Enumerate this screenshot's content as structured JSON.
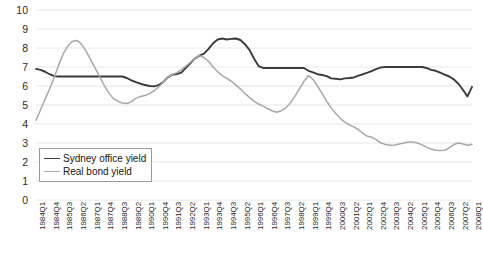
{
  "chart_data": {
    "type": "line",
    "title": "",
    "xlabel": "",
    "ylabel": "",
    "ylim": [
      0,
      10
    ],
    "yticks": [
      0,
      1,
      2,
      3,
      4,
      5,
      6,
      7,
      8,
      9,
      10
    ],
    "grid": true,
    "grid_axis": "y",
    "legend_position": "lower-left-inside",
    "x": [
      "1984Q1",
      "1984Q2",
      "1984Q3",
      "1984Q4",
      "1985Q1",
      "1985Q2",
      "1985Q3",
      "1985Q4",
      "1986Q1",
      "1986Q2",
      "1986Q3",
      "1986Q4",
      "1987Q1",
      "1987Q2",
      "1987Q3",
      "1987Q4",
      "1988Q1",
      "1988Q2",
      "1988Q3",
      "1988Q4",
      "1989Q1",
      "1989Q2",
      "1989Q3",
      "1989Q4",
      "1990Q1",
      "1990Q2",
      "1990Q3",
      "1990Q4",
      "1991Q1",
      "1991Q2",
      "1991Q3",
      "1991Q4",
      "1992Q1",
      "1992Q2",
      "1992Q3",
      "1992Q4",
      "1993Q1",
      "1993Q2",
      "1993Q3",
      "1993Q4",
      "1994Q1",
      "1994Q2",
      "1994Q3",
      "1994Q4",
      "1995Q1",
      "1995Q2",
      "1995Q3",
      "1995Q4",
      "1996Q1",
      "1996Q2",
      "1996Q3",
      "1996Q4",
      "1997Q1",
      "1997Q2",
      "1997Q3",
      "1997Q4",
      "1998Q1",
      "1998Q2",
      "1998Q3",
      "1998Q4",
      "1999Q1",
      "1999Q2",
      "1999Q3",
      "1999Q4",
      "2000Q1",
      "2000Q2",
      "2000Q3",
      "2000Q4",
      "2001Q1",
      "2001Q2",
      "2001Q3",
      "2001Q4",
      "2002Q1",
      "2002Q2",
      "2002Q3",
      "2002Q4",
      "2003Q1",
      "2003Q2",
      "2003Q3",
      "2003Q4",
      "2004Q1",
      "2004Q2",
      "2004Q3",
      "2004Q4",
      "2005Q1",
      "2005Q2",
      "2005Q3",
      "2005Q4",
      "2006Q1",
      "2006Q2",
      "2006Q3",
      "2006Q4",
      "2007Q1",
      "2007Q2",
      "2007Q3",
      "2007Q4",
      "2008Q1"
    ],
    "xtick_labels": [
      "1984Q1",
      "1984Q4",
      "1985Q3",
      "1986Q2",
      "1987Q1",
      "1987Q4",
      "1988Q3",
      "1989Q2",
      "1990Q1",
      "1990Q4",
      "1991Q3",
      "1992Q2",
      "1993Q1",
      "1993Q4",
      "1994Q3",
      "1995Q2",
      "1996Q1",
      "1996Q4",
      "1997Q3",
      "1998Q2",
      "1999Q1",
      "1999Q4",
      "2000Q3",
      "2001Q2",
      "2002Q1",
      "2002Q4",
      "2003Q3",
      "2004Q2",
      "2005Q1",
      "2005Q4",
      "2006Q3",
      "2007Q2",
      "2008Q1"
    ],
    "xtick_step": 3,
    "series": [
      {
        "name": "Sydney office yield",
        "color": "#3a3a3a",
        "values": [
          6.9,
          6.85,
          6.75,
          6.62,
          6.52,
          6.5,
          6.5,
          6.5,
          6.5,
          6.5,
          6.5,
          6.5,
          6.5,
          6.5,
          6.5,
          6.5,
          6.5,
          6.5,
          6.5,
          6.5,
          6.42,
          6.3,
          6.2,
          6.12,
          6.05,
          6.0,
          5.98,
          6.05,
          6.2,
          6.45,
          6.6,
          6.62,
          6.7,
          6.95,
          7.2,
          7.45,
          7.6,
          7.7,
          7.95,
          8.25,
          8.45,
          8.5,
          8.45,
          8.48,
          8.5,
          8.42,
          8.2,
          7.9,
          7.45,
          7.05,
          6.95,
          6.95,
          6.95,
          6.95,
          6.95,
          6.95,
          6.95,
          6.95,
          6.95,
          6.95,
          6.8,
          6.72,
          6.62,
          6.58,
          6.52,
          6.4,
          6.38,
          6.35,
          6.4,
          6.42,
          6.45,
          6.55,
          6.62,
          6.7,
          6.8,
          6.9,
          6.98,
          7.0,
          7.0,
          7.0,
          7.0,
          7.0,
          7.0,
          7.0,
          7.0,
          7.0,
          6.95,
          6.85,
          6.8,
          6.7,
          6.6,
          6.5,
          6.35,
          6.12,
          5.8,
          5.45,
          5.95
        ]
      },
      {
        "name": "Real bond yield",
        "color": "#a8a8a8",
        "values": [
          4.2,
          4.75,
          5.3,
          5.85,
          6.45,
          7.1,
          7.7,
          8.1,
          8.35,
          8.4,
          8.2,
          7.85,
          7.4,
          6.95,
          6.5,
          6.05,
          5.65,
          5.35,
          5.2,
          5.1,
          5.08,
          5.18,
          5.35,
          5.45,
          5.5,
          5.6,
          5.75,
          5.95,
          6.2,
          6.45,
          6.6,
          6.7,
          6.85,
          7.05,
          7.25,
          7.45,
          7.6,
          7.5,
          7.3,
          7.0,
          6.75,
          6.55,
          6.4,
          6.25,
          6.05,
          5.85,
          5.6,
          5.4,
          5.2,
          5.05,
          4.95,
          4.8,
          4.7,
          4.62,
          4.7,
          4.85,
          5.1,
          5.45,
          5.85,
          6.25,
          6.55,
          6.35,
          6.0,
          5.6,
          5.2,
          4.85,
          4.55,
          4.3,
          4.1,
          3.95,
          3.85,
          3.7,
          3.5,
          3.35,
          3.3,
          3.15,
          3.0,
          2.92,
          2.88,
          2.9,
          2.95,
          3.0,
          3.05,
          3.05,
          3.0,
          2.9,
          2.78,
          2.68,
          2.62,
          2.6,
          2.62,
          2.75,
          2.92,
          3.0,
          2.95,
          2.88,
          2.92
        ]
      }
    ]
  },
  "legend": {
    "items": [
      {
        "label": "Sydney office yield"
      },
      {
        "label": "Real bond yield"
      }
    ]
  }
}
